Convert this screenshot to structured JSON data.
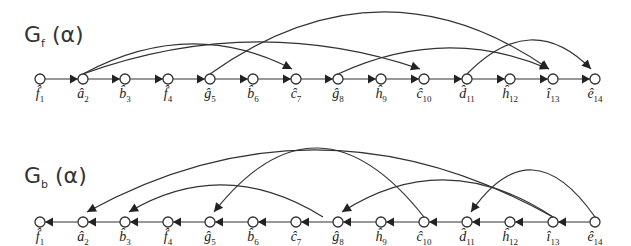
{
  "graphs": [
    {
      "name": "forward",
      "title_main": "G",
      "title_sub": "f",
      "title_arg": " (α)",
      "row_y": 79,
      "direction": "forward",
      "nodes": [
        {
          "letter": "f̂",
          "idx": "1",
          "x": 40
        },
        {
          "letter": "â",
          "idx": "2",
          "x": 83
        },
        {
          "letter": "b̂",
          "idx": "3",
          "x": 125
        },
        {
          "letter": "f̂",
          "idx": "4",
          "x": 168
        },
        {
          "letter": "ĝ",
          "idx": "5",
          "x": 210
        },
        {
          "letter": "b̂",
          "idx": "6",
          "x": 253
        },
        {
          "letter": "ĉ",
          "idx": "7",
          "x": 296
        },
        {
          "letter": "ĝ",
          "idx": "8",
          "x": 338
        },
        {
          "letter": "ĥ",
          "idx": "9",
          "x": 381
        },
        {
          "letter": "ĉ",
          "idx": "10",
          "x": 424
        },
        {
          "letter": "d̂",
          "idx": "11",
          "x": 467
        },
        {
          "letter": "ĥ",
          "idx": "12",
          "x": 510
        },
        {
          "letter": "î",
          "idx": "13",
          "x": 553
        },
        {
          "letter": "ê",
          "idx": "14",
          "x": 595
        }
      ],
      "arcs": [
        {
          "from": "a2",
          "to": "c7",
          "peak": 44
        },
        {
          "from": "a2",
          "to": "c10",
          "peak": 42
        },
        {
          "from": "g5",
          "to": "i13",
          "peak": 12
        },
        {
          "from": "g8",
          "to": "i13",
          "peak": 48
        },
        {
          "from": "d11",
          "to": "e14",
          "peak": 40
        }
      ]
    },
    {
      "name": "backward",
      "title_main": "G",
      "title_sub": "b",
      "title_arg": " (α)",
      "row_y": 222,
      "direction": "backward",
      "nodes": [
        {
          "letter": "f̂",
          "idx": "1",
          "x": 40
        },
        {
          "letter": "â",
          "idx": "2",
          "x": 83
        },
        {
          "letter": "b̂",
          "idx": "3",
          "x": 125
        },
        {
          "letter": "f̂",
          "idx": "4",
          "x": 168
        },
        {
          "letter": "ĝ",
          "idx": "5",
          "x": 210
        },
        {
          "letter": "b̂",
          "idx": "6",
          "x": 253
        },
        {
          "letter": "ĉ",
          "idx": "7",
          "x": 296
        },
        {
          "letter": "ĝ",
          "idx": "8",
          "x": 338
        },
        {
          "letter": "ĥ",
          "idx": "9",
          "x": 381
        },
        {
          "letter": "ĉ",
          "idx": "10",
          "x": 424
        },
        {
          "letter": "d̂",
          "idx": "11",
          "x": 467
        },
        {
          "letter": "ĥ",
          "idx": "12",
          "x": 510
        },
        {
          "letter": "î",
          "idx": "13",
          "x": 553
        },
        {
          "letter": "ê",
          "idx": "14",
          "x": 595
        }
      ],
      "arcs": [
        {
          "from": "i13",
          "to": "a2",
          "peak": 150
        },
        {
          "from": "c10",
          "to": "g5",
          "peak": 148
        },
        {
          "from": "g8",
          "to": "b3",
          "peak": 185
        },
        {
          "from": "i13",
          "to": "g8",
          "peak": 180
        },
        {
          "from": "e14",
          "to": "d11",
          "peak": 170
        }
      ]
    }
  ]
}
